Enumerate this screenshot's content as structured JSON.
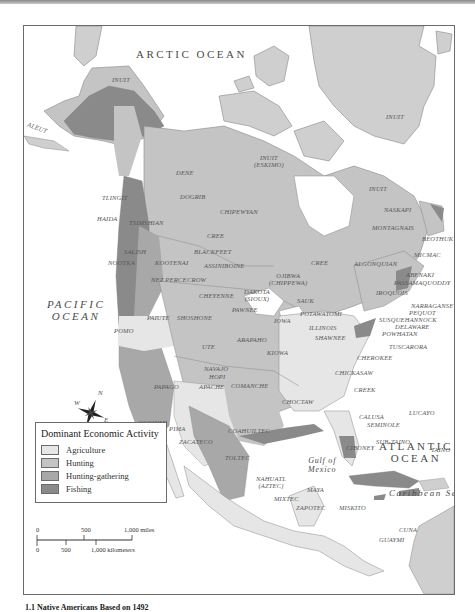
{
  "map": {
    "oceans": {
      "arctic": "ARCTIC OCEAN",
      "pacific_line1": "PACIFIC",
      "pacific_line2": "OCEAN",
      "atlantic_line1": "ATLANTIC",
      "atlantic_line2": "OCEAN",
      "gulf_line1": "Gulf of",
      "gulf_line2": "Mexico",
      "caribbean": "Caribbean Sea"
    },
    "peoples": {
      "inuit_alaska": "INUIT",
      "aleut": "ALEUT",
      "inuit_greenland": "INUIT",
      "inuit_eskimo_line1": "INUIT",
      "inuit_eskimo_line2": "(ESKIMO)",
      "inuit_labrador": "INUIT",
      "dene": "DENE",
      "dogrib": "DOGRIB",
      "tlingit": "TLINGIT",
      "haida": "HAIDA",
      "tsimshian": "TSIMSHIAN",
      "chipewyan": "CHIPEWYAN",
      "naskapi": "NASKAPI",
      "montagnais": "MONTAGNAIS",
      "beothuk": "BEOTHUK",
      "cree_west": "CREE",
      "cree_east": "CREE",
      "blackfeet": "BLACKFEET",
      "salish": "SALISH",
      "nootka": "NOOTKA",
      "kootenai": "KOOTENAI",
      "assiniboine": "ASSINIBOINE",
      "algonquian": "ALGONQUIAN",
      "micmac": "MICMAC",
      "abenaki": "ABENAKI",
      "passamaquoddy": "PASSAMAQUODDY",
      "nez_perce": "NEZ PERCE",
      "crow": "CROW",
      "ojibwa_line1": "OJIBWA",
      "ojibwa_line2": "(CHIPPEWA)",
      "iroquois": "IROQUOIS",
      "narragansett": "NARRAGANSETT",
      "pequot": "PEQUOT",
      "susquehannock": "SUSQUEHANNOCK",
      "delaware": "DELAWARE",
      "dakota_line1": "DAKOTA",
      "dakota_line2": "(SIOUX)",
      "sauk": "SAUK",
      "potawatomi": "POTAWATOMI",
      "cheyenne": "CHEYENNE",
      "pawnee": "PAWNEE",
      "paiute": "PAIUTE",
      "shoshone": "SHOSHONE",
      "pomo": "POMO",
      "iowa": "IOWA",
      "illinois": "ILLINOIS",
      "shawnee": "SHAWNEE",
      "powhatan": "POWHATAN",
      "tuscarora": "TUSCARORA",
      "ute": "UTE",
      "arapaho": "ARAPAHO",
      "kiowa": "KIOWA",
      "cherokee": "CHEROKEE",
      "chickasaw": "CHICKASAW",
      "navajo": "NAVAJO",
      "hopi": "HOPI",
      "papago": "PAPAGO",
      "apache": "APACHE",
      "comanche": "COMANCHE",
      "creek": "CREEK",
      "choctaw": "CHOCTAW",
      "calusa": "CALUSA",
      "seminole": "SEMINOLE",
      "lucayo": "LUCAYO",
      "cochimi": "COCHIMI",
      "pima": "PIMA",
      "coahuiltec": "COAHUILTEC",
      "zacateco": "ZACATECO",
      "sub_taino": "SUB-TAINO",
      "ciboney": "CIBONEY",
      "taino": "TAINO",
      "toltec": "TOLTEC",
      "nahuatl_line1": "NAHUATL",
      "nahuatl_line2": "(AZTEC)",
      "maya": "MAYA",
      "mixtec": "MIXTEC",
      "zapotec": "ZAPOTEC",
      "miskito": "MISKITO",
      "cuna": "CUNA",
      "guaymi": "GUAYMI"
    },
    "compass": {
      "n": "N",
      "s": "S",
      "e": "E",
      "w": "W"
    }
  },
  "legend": {
    "title": "Dominant Economic Activity",
    "items": [
      {
        "label": "Agriculture",
        "color": "#e6e6e6"
      },
      {
        "label": "Hunting",
        "color": "#c4c4c4"
      },
      {
        "label": "Hunting-gathering",
        "color": "#a8a8a8"
      },
      {
        "label": "Fishing",
        "color": "#8a8a8a"
      }
    ]
  },
  "scale": {
    "miles_0": "0",
    "miles_500": "500",
    "miles_1000": "1,000 miles",
    "km_0": "0",
    "km_500": "500",
    "km_1000": "1,000 kilometers"
  },
  "caption": "1.1 Native Americans Based on 1492"
}
